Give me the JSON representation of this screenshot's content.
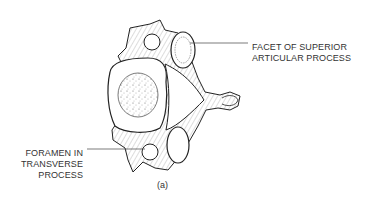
{
  "diagram": {
    "labels": {
      "facet": [
        "FACET OF SUPERIOR",
        "ARTICULAR PROCESS"
      ],
      "foramen": [
        "FORAMEN IN",
        "TRANSVERSE",
        "PROCESS"
      ]
    },
    "caption": "(a)"
  }
}
